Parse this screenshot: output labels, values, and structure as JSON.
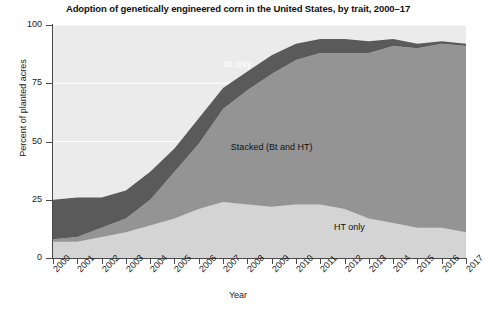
{
  "chart_data": {
    "type": "area",
    "title": "Adoption of genetically engineered corn in the United States, by trait, 2000–17",
    "xlabel": "Year",
    "ylabel": "Percent of planted acres",
    "stacked": true,
    "grid": true,
    "legend_position": "inline-annotations",
    "xlim": [
      2000,
      2017
    ],
    "ylim": [
      0,
      100
    ],
    "yticks": [
      0,
      25,
      50,
      75,
      100
    ],
    "ytick_labels": [
      "0",
      "25",
      "50",
      "75",
      "100"
    ],
    "categories": [
      "2000",
      "2001",
      "2002",
      "2003",
      "2004",
      "2005",
      "2006",
      "2007",
      "2008",
      "2009",
      "2010",
      "2011",
      "2012",
      "2013",
      "2014",
      "2015",
      "2016",
      "2017"
    ],
    "series": [
      {
        "name": "HT only",
        "color": "#d4d4d4",
        "values": [
          7,
          7,
          9,
          11,
          14,
          17,
          21,
          24,
          23,
          22,
          23,
          23,
          21,
          17,
          15,
          13,
          13,
          11
        ]
      },
      {
        "name": "Stacked (Bt and HT)",
        "color": "#949494",
        "values": [
          1,
          2,
          4,
          6,
          11,
          20,
          28,
          40,
          49,
          57,
          62,
          65,
          67,
          71,
          76,
          77,
          79,
          80
        ]
      },
      {
        "name": "Bt only",
        "color": "#5a5a5a",
        "values": [
          17,
          17,
          13,
          12,
          12,
          10,
          11,
          9,
          8,
          8,
          7,
          6,
          6,
          5,
          3,
          2,
          1,
          1
        ]
      }
    ],
    "totals": [
      25,
      26,
      26,
      29,
      37,
      47,
      60,
      73,
      80,
      87,
      92,
      94,
      94,
      93,
      94,
      92,
      93,
      92
    ],
    "annotations": [
      {
        "text": "Bt only",
        "x": 2007.6,
        "y": 83,
        "color": "#ffffff"
      },
      {
        "text": "Stacked (Bt and HT)",
        "x": 2009.0,
        "y": 47,
        "color": "#111111"
      },
      {
        "text": "HT only",
        "x": 2012.2,
        "y": 13,
        "color": "#111111"
      }
    ],
    "plot_background": "#ebebeb",
    "gridline_color": "#ffffff",
    "axis_color": "#4a4a4a"
  }
}
